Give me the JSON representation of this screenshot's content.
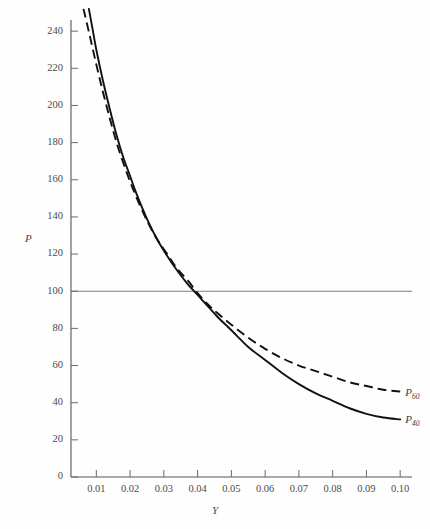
{
  "chart_data": {
    "type": "line",
    "title": "",
    "xlabel": "Y",
    "ylabel": "P",
    "xlim": [
      0.0025,
      0.1035
    ],
    "ylim": [
      0,
      246
    ],
    "grid": false,
    "legend_position": "right-inline",
    "xticks": [
      "0.01",
      "0.02",
      "0.03",
      "0.04",
      "0.05",
      "0.06",
      "0.07",
      "0.08",
      "0.09",
      "0.10"
    ],
    "xtick_values": [
      0.01,
      0.02,
      0.03,
      0.04,
      0.05,
      0.06,
      0.07,
      0.08,
      0.09,
      0.1
    ],
    "yticks": [
      "0",
      "20",
      "40",
      "60",
      "80",
      "100",
      "120",
      "140",
      "160",
      "180",
      "200",
      "220",
      "240"
    ],
    "ytick_values": [
      0,
      20,
      40,
      60,
      80,
      100,
      120,
      140,
      160,
      180,
      200,
      220,
      240
    ],
    "annotations": [
      {
        "name": "reference-line",
        "type": "hline",
        "value": 100,
        "style": "solid",
        "color": "#7d7d7d"
      }
    ],
    "series": [
      {
        "name": "P_60",
        "label": "P",
        "subscript": "60",
        "style": "dashed",
        "color": "#111111",
        "x": [
          0.0062,
          0.008,
          0.01,
          0.012,
          0.014,
          0.016,
          0.018,
          0.02,
          0.022,
          0.025,
          0.028,
          0.031,
          0.034,
          0.037,
          0.04,
          0.043,
          0.046,
          0.05,
          0.055,
          0.06,
          0.065,
          0.07,
          0.075,
          0.08,
          0.085,
          0.09,
          0.095,
          0.1
        ],
        "y": [
          252,
          238,
          222,
          207,
          193,
          180,
          169,
          159,
          150,
          138,
          128,
          120,
          112,
          106,
          99,
          93,
          88,
          82,
          75,
          69,
          64,
          60,
          57,
          54,
          51,
          49,
          47,
          46
        ]
      },
      {
        "name": "P_40",
        "label": "P",
        "subscript": "40",
        "style": "solid",
        "color": "#111111",
        "x": [
          0.0078,
          0.009,
          0.01,
          0.012,
          0.014,
          0.016,
          0.018,
          0.02,
          0.022,
          0.025,
          0.028,
          0.031,
          0.034,
          0.037,
          0.04,
          0.043,
          0.046,
          0.05,
          0.055,
          0.06,
          0.065,
          0.07,
          0.075,
          0.08,
          0.085,
          0.09,
          0.095,
          0.1
        ],
        "y": [
          252,
          240,
          230,
          213,
          198,
          184,
          172,
          162,
          152,
          139,
          128,
          119,
          111,
          104,
          98,
          92,
          86,
          79,
          70,
          63,
          56,
          50,
          45,
          41,
          37,
          34,
          32,
          31
        ]
      }
    ]
  },
  "axis_titles": {
    "y": "P",
    "x": "Y"
  }
}
